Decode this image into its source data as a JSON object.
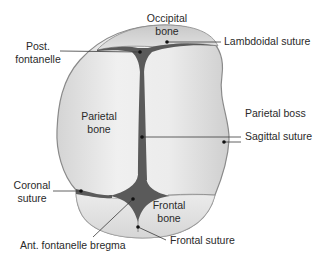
{
  "diagram": {
    "colors": {
      "bone_fill": "#e6e6e6",
      "bone_outline": "#8a8a8a",
      "suture_fill": "#5a5a5a",
      "leader_line": "#3a3a3a",
      "text": "#2a2a2a"
    },
    "bones": {
      "occipital": {
        "line1": "Occipital",
        "line2": "bone"
      },
      "parietal": {
        "line1": "Parietal",
        "line2": "bone"
      },
      "frontal": {
        "line1": "Frontal",
        "line2": "bone"
      }
    },
    "callouts": {
      "post_fontanelle": {
        "line1": "Post.",
        "line2": "fontanelle"
      },
      "lambdoidal_suture": {
        "text": "Lambdoidal suture"
      },
      "parietal_boss": {
        "text": "Parietal boss"
      },
      "sagittal_suture": {
        "text": "Sagittal suture"
      },
      "coronal_suture": {
        "line1": "Coronal",
        "line2": "suture"
      },
      "ant_fontanelle": {
        "text": "Ant. fontanelle bregma"
      },
      "frontal_suture": {
        "text": "Frontal suture"
      }
    }
  }
}
